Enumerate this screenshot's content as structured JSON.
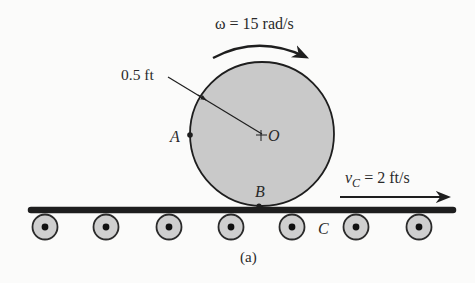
{
  "figure": {
    "caption": "(a)",
    "angular_velocity": {
      "symbol": "ω",
      "equals": " = ",
      "value": "15 rad/s",
      "direction": "clockwise"
    },
    "radius_label": "0.5 ft",
    "points": {
      "A": "A",
      "B": "B",
      "O": "O",
      "C": "C"
    },
    "belt_velocity": {
      "symbol": "v",
      "subscript": "C",
      "equals": " = ",
      "value": "2 ft/s",
      "direction": "right"
    },
    "rollers_count": 7,
    "colors": {
      "disk_fill": "#c9c9c9",
      "line": "#1e1e1e",
      "roller_fill": "#cfcfcf",
      "background": "#fbfbfa"
    }
  }
}
